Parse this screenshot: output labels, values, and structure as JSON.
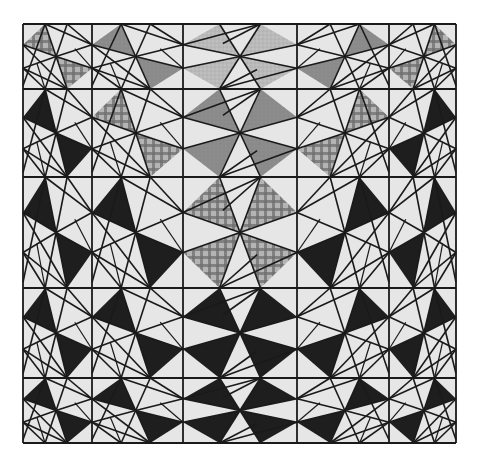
{
  "image": {
    "subject": "pinwheel quilt pattern",
    "grid_rows": 5,
    "grid_cols": 5
  },
  "colors": {
    "background": "#e6e6e6",
    "line": "#1a1a1a",
    "dark": "#1e1e1e",
    "medium": "#8a8a8a",
    "light": "#b9b9b9",
    "plaid_a": "#6e6e6e",
    "plaid_b": "#b4b4b4"
  },
  "blocks": [
    [
      "plaid",
      "medium",
      "light",
      "medium",
      "plaid"
    ],
    [
      "dark",
      "plaid",
      "medium",
      "plaid",
      "dark"
    ],
    [
      "dark",
      "dark",
      "plaid",
      "dark",
      "dark"
    ],
    [
      "dark",
      "dark",
      "dark",
      "dark",
      "dark"
    ],
    [
      "dark",
      "dark",
      "dark",
      "dark",
      "dark"
    ]
  ],
  "orientation_by_column": [
    "left",
    "left",
    "full",
    "right",
    "right"
  ]
}
